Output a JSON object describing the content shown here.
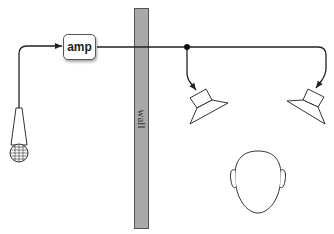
{
  "diagram": {
    "type": "signal-flow",
    "nodes": {
      "microphone": {
        "icon": "microphone-icon"
      },
      "amp": {
        "label": "amp"
      },
      "wall": {
        "label": "wall",
        "color": "#a9a9a9"
      },
      "speaker_left": {
        "icon": "speaker-icon"
      },
      "speaker_right": {
        "icon": "speaker-icon"
      },
      "listener": {
        "icon": "head-icon"
      }
    },
    "edges": [
      {
        "from": "microphone",
        "to": "amp"
      },
      {
        "from": "amp",
        "to": "speaker_left",
        "via": "junction"
      },
      {
        "from": "amp",
        "to": "speaker_right",
        "via": "junction"
      }
    ]
  }
}
